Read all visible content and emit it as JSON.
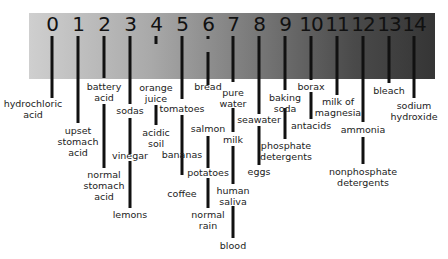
{
  "scale": {
    "numbers": [
      "0",
      "1",
      "2",
      "3",
      "4",
      "5",
      "6",
      "7",
      "8",
      "9",
      "10",
      "11",
      "12",
      "13",
      "14"
    ],
    "gradient_colors": {
      "acidic_end": "#cfcfcf",
      "basic_end": "#353535"
    }
  },
  "substances": [
    {
      "ph": 0,
      "label": "hydrochloric\nacid"
    },
    {
      "ph": 1,
      "label": "upset\nstomach\nacid"
    },
    {
      "ph": 2,
      "label": "battery\nacid"
    },
    {
      "ph": 2,
      "label": "normal\nstomach\nacid"
    },
    {
      "ph": 3,
      "label": "sodas"
    },
    {
      "ph": 3,
      "label": "vinegar"
    },
    {
      "ph": 3,
      "label": "lemons"
    },
    {
      "ph": 4,
      "label": "orange\njuice"
    },
    {
      "ph": 4,
      "label": "acidic\nsoil"
    },
    {
      "ph": 5,
      "label": "tomatoes"
    },
    {
      "ph": 5,
      "label": "bananas"
    },
    {
      "ph": 5,
      "label": "coffee"
    },
    {
      "ph": 6,
      "label": "bread"
    },
    {
      "ph": 6,
      "label": "salmon"
    },
    {
      "ph": 6,
      "label": "potatoes"
    },
    {
      "ph": 6,
      "label": "normal\nrain"
    },
    {
      "ph": 7,
      "label": "pure\nwater"
    },
    {
      "ph": 7,
      "label": "milk"
    },
    {
      "ph": 7,
      "label": "human\nsaliva"
    },
    {
      "ph": 7,
      "label": "blood"
    },
    {
      "ph": 8,
      "label": "seawater"
    },
    {
      "ph": 8,
      "label": "eggs"
    },
    {
      "ph": 9,
      "label": "baking\nsoda"
    },
    {
      "ph": 9,
      "label": "phosphate\ndetergents"
    },
    {
      "ph": 10,
      "label": "borax"
    },
    {
      "ph": 10,
      "label": "antacids"
    },
    {
      "ph": 11,
      "label": "milk of\nmagnesia"
    },
    {
      "ph": 12,
      "label": "ammonia"
    },
    {
      "ph": 12,
      "label": "nonphosphate\ndetergents"
    },
    {
      "ph": 13,
      "label": "bleach"
    },
    {
      "ph": 14,
      "label": "sodium\nhydroxide"
    }
  ]
}
